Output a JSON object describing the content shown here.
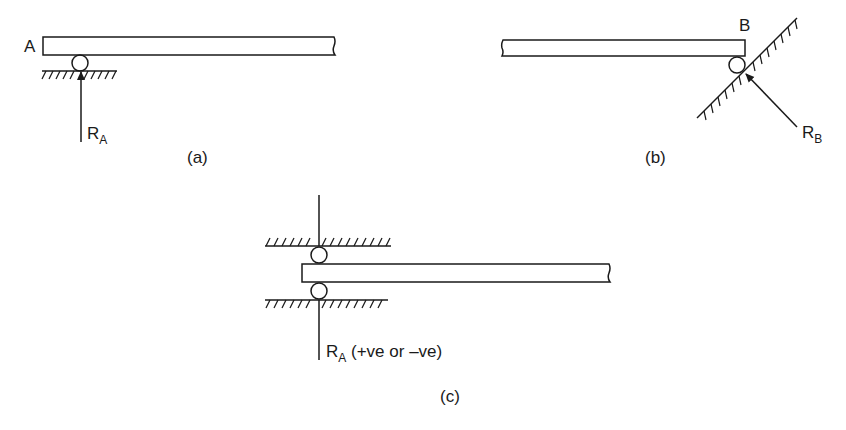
{
  "figure": {
    "panels": [
      {
        "id": "a",
        "caption": "(a)",
        "end_label": "A",
        "reaction": {
          "symbol": "R",
          "subscript": "A",
          "suffix": ""
        },
        "support": "roller on horizontal surface",
        "reaction_direction": "vertical upward"
      },
      {
        "id": "b",
        "caption": "(b)",
        "end_label": "B",
        "reaction": {
          "symbol": "R",
          "subscript": "B",
          "suffix": ""
        },
        "support": "roller on inclined surface",
        "reaction_direction": "normal to inclined surface"
      },
      {
        "id": "c",
        "caption": "(c)",
        "end_label": "",
        "reaction": {
          "symbol": "R",
          "subscript": "A",
          "suffix": " (+ve or –ve)"
        },
        "support": "rollers between two horizontal surfaces",
        "reaction_direction": "vertical, either sense"
      }
    ]
  },
  "colors": {
    "ink": "#1a1a1a",
    "background": "#ffffff"
  }
}
